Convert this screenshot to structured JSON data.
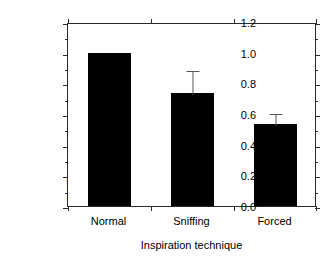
{
  "chart_data": {
    "type": "bar",
    "title": "",
    "subtitle": "",
    "xlabel": "Inspiration technique",
    "ylabel": "2,3-Butanedione concentration relative to 'Normal' level",
    "ylabel_lines": [
      "2,3-Butanedione concentration",
      "relative to 'Normal' level"
    ],
    "categories": [
      "Normal",
      "Sniffing",
      "Forced"
    ],
    "values": [
      1.0,
      0.74,
      0.535
    ],
    "errors": [
      0.0,
      0.155,
      0.08
    ],
    "error_type": "upper-only",
    "ylim": [
      0.0,
      1.2
    ],
    "xlim": [
      0,
      3
    ],
    "ytick_labels": [
      "0.0",
      "0.2",
      "0.4",
      "0.6",
      "0.8",
      "1.0",
      "1.2"
    ],
    "ytick_values": [
      0.0,
      0.2,
      0.4,
      0.6,
      0.8,
      1.0,
      1.2
    ],
    "yminor_values": [
      0.1,
      0.3,
      0.5,
      0.7,
      0.9,
      1.1
    ],
    "grid": false,
    "legend": null,
    "legend_position": "none",
    "bar_color": "#000000",
    "frame_color": "#2a2a2a",
    "background": "#ffffff",
    "annotations": []
  }
}
